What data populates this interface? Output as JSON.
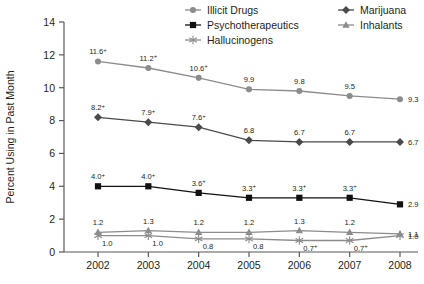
{
  "chart_data": {
    "type": "line",
    "title": "",
    "subtitle": "",
    "xlabel": "",
    "ylabel": "Percent Using in Past Month",
    "categories": [
      "2002",
      "2003",
      "2004",
      "2005",
      "2006",
      "2007",
      "2008"
    ],
    "x": [
      2002,
      2003,
      2004,
      2005,
      2006,
      2007,
      2008
    ],
    "ylim": [
      0,
      14
    ],
    "yticks": [
      0,
      2,
      4,
      6,
      8,
      10,
      12,
      14
    ],
    "ytick_labels": [
      "0",
      "2",
      "4",
      "6",
      "8",
      "10",
      "12",
      "14"
    ],
    "grid": false,
    "legend_position": "top-right",
    "annotation_note": "+ denotes statistically significant difference from 2008",
    "series": [
      {
        "name": "Illicit Drugs",
        "marker": "circle",
        "color": "#8c8c8c",
        "values": [
          11.6,
          11.2,
          10.6,
          9.9,
          9.8,
          9.5,
          9.3
        ],
        "labels": [
          "11.6",
          "11.2",
          "10.6",
          "9.9",
          "9.8",
          "9.5",
          "9.3"
        ],
        "significance": [
          "+",
          "+",
          "+",
          "",
          "",
          "",
          ""
        ]
      },
      {
        "name": "Marijuana",
        "marker": "diamond",
        "color": "#4a4a4a",
        "values": [
          8.2,
          7.9,
          7.6,
          6.8,
          6.7,
          6.7,
          6.7
        ],
        "labels": [
          "8.2",
          "7.9",
          "7.6",
          "6.8",
          "6.7",
          "6.7",
          "6.7"
        ],
        "significance": [
          "+",
          "+",
          "+",
          "",
          "",
          "",
          ""
        ]
      },
      {
        "name": "Psychotherapeutics",
        "marker": "square",
        "color": "#111111",
        "values": [
          4.0,
          4.0,
          3.6,
          3.3,
          3.3,
          3.3,
          2.9
        ],
        "labels": [
          "4.0",
          "4.0",
          "3.6",
          "3.3",
          "3.3",
          "3.3",
          "2.9"
        ],
        "significance": [
          "+",
          "+",
          "+",
          "+",
          "+",
          "+",
          ""
        ]
      },
      {
        "name": "Inhalants",
        "marker": "triangle",
        "color": "#8c8c8c",
        "values": [
          1.2,
          1.3,
          1.2,
          1.2,
          1.3,
          1.2,
          1.1
        ],
        "labels": [
          "1.2",
          "1.3",
          "1.2",
          "1.2",
          "1.3",
          "1.2",
          "1.1"
        ],
        "significance": [
          "",
          "",
          "",
          "",
          "",
          "",
          ""
        ]
      },
      {
        "name": "Hallucinogens",
        "marker": "asterisk",
        "color": "#8c8c8c",
        "values": [
          1.0,
          1.0,
          0.8,
          0.8,
          0.7,
          0.7,
          1.0
        ],
        "labels": [
          "1.0",
          "1.0",
          "0.8",
          "0.8",
          "0.7",
          "0.7",
          "1.0"
        ],
        "significance": [
          "",
          "",
          "",
          "",
          "+",
          "+",
          ""
        ]
      }
    ]
  },
  "legend": {
    "entries": [
      {
        "label": "Illicit Drugs",
        "marker": "circle",
        "color": "#8c8c8c"
      },
      {
        "label": "Marijuana",
        "marker": "diamond",
        "color": "#4a4a4a"
      },
      {
        "label": "Psychotherapeutics",
        "marker": "square",
        "color": "#111111"
      },
      {
        "label": "Inhalants",
        "marker": "triangle",
        "color": "#8c8c8c"
      },
      {
        "label": "Hallucinogens",
        "marker": "asterisk",
        "color": "#8c8c8c"
      }
    ]
  },
  "axes": {
    "y_title": "Percent Using in Past Month",
    "y_ticks": [
      "14",
      "12",
      "10",
      "8",
      "6",
      "4",
      "2",
      "0"
    ],
    "x_ticks": [
      "2002",
      "2003",
      "2004",
      "2005",
      "2006",
      "2007",
      "2008"
    ]
  },
  "colors": {
    "axis": "#58595b",
    "text": "#231f20",
    "gray_series": "#8c8c8c",
    "dark_series": "#4a4a4a",
    "black_series": "#111111"
  }
}
